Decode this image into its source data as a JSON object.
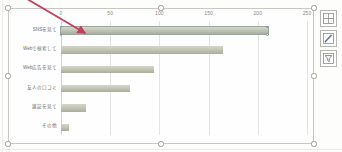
{
  "chart_data": {
    "type": "bar",
    "orientation": "horizontal",
    "title": "",
    "xlabel": "",
    "ylabel": "",
    "xlim": [
      0,
      250
    ],
    "grid": true,
    "legend": false,
    "axis_position": "top",
    "categories": [
      "SNSを見て",
      "Webで検索して",
      "Web広告を見て",
      "友人の口コミ",
      "雑誌を見て",
      "その他"
    ],
    "values": [
      210,
      165,
      95,
      70,
      25,
      8
    ],
    "tick_labels": [
      "0",
      "50",
      "100",
      "150",
      "200",
      "250"
    ],
    "tick_values": [
      0,
      50,
      100,
      150,
      200,
      250
    ],
    "series": [
      {
        "name": "回答数",
        "values": [
          210,
          165,
          95,
          70,
          25,
          8
        ]
      }
    ],
    "bar_color": "#c3c6b6",
    "selected_series_index": 0
  },
  "chart_object": {
    "state": "selected",
    "handles": [
      "top-left",
      "top-center",
      "top-right",
      "middle-left",
      "middle-right",
      "bottom-left",
      "bottom-center",
      "bottom-right"
    ]
  },
  "chart_buttons": [
    {
      "name": "chart-elements-button",
      "icon": "plus-icon",
      "label": "グラフ要素"
    },
    {
      "name": "chart-styles-button",
      "icon": "brush-icon",
      "label": "グラフ スタイル"
    },
    {
      "name": "chart-filters-button",
      "icon": "funnel-icon",
      "label": "グラフ フィルター"
    }
  ],
  "annotation": {
    "type": "arrow",
    "color": "#c2405a",
    "points_to": "first-bar"
  }
}
